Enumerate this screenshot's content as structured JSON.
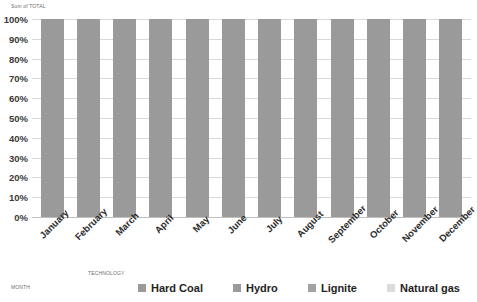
{
  "pivot": {
    "value_field": "Sum of TOTAL",
    "row_field": "TECHNOLOGY",
    "column_field": "MONTH"
  },
  "chart_data": {
    "type": "bar",
    "stacked": "100%",
    "title": "Sum of TOTAL",
    "xlabel": "MONTH",
    "ylabel": "",
    "grid": true,
    "legend_position": "bottom",
    "ylim": [
      0,
      100
    ],
    "yticks": [
      "0%",
      "10%",
      "20%",
      "30%",
      "40%",
      "50%",
      "60%",
      "70%",
      "80%",
      "90%",
      "100%"
    ],
    "categories": [
      "January",
      "February",
      "March",
      "April",
      "May",
      "June",
      "July",
      "August",
      "September",
      "October",
      "November",
      "December"
    ],
    "series": [
      {
        "name": "Hard Coal",
        "color": "#9a9a9a",
        "values": [
          100,
          100,
          100,
          100,
          100,
          100,
          100,
          100,
          100,
          100,
          100,
          100
        ]
      },
      {
        "name": "Hydro",
        "color": "#9a9a9a",
        "values": [
          0,
          0,
          0,
          0,
          0,
          0,
          0,
          0,
          0,
          0,
          0,
          0
        ]
      },
      {
        "name": "Lignite",
        "color": "#a3a3a3",
        "values": [
          0,
          0,
          0,
          0,
          0,
          0,
          0,
          0,
          0,
          0,
          0,
          0
        ]
      },
      {
        "name": "Natural gas",
        "color": "#dcdcdc",
        "values": [
          0,
          0,
          0,
          0,
          0,
          0,
          0,
          0,
          0,
          0,
          0,
          0
        ]
      }
    ],
    "colors": {
      "bar": "#9a9a9a",
      "gridline": "#d9d9d9",
      "baseline": "#bfbfbf",
      "tick_label": "#3a3a3a",
      "legend_label": "#1f1f1f",
      "background": "#ffffff"
    }
  }
}
